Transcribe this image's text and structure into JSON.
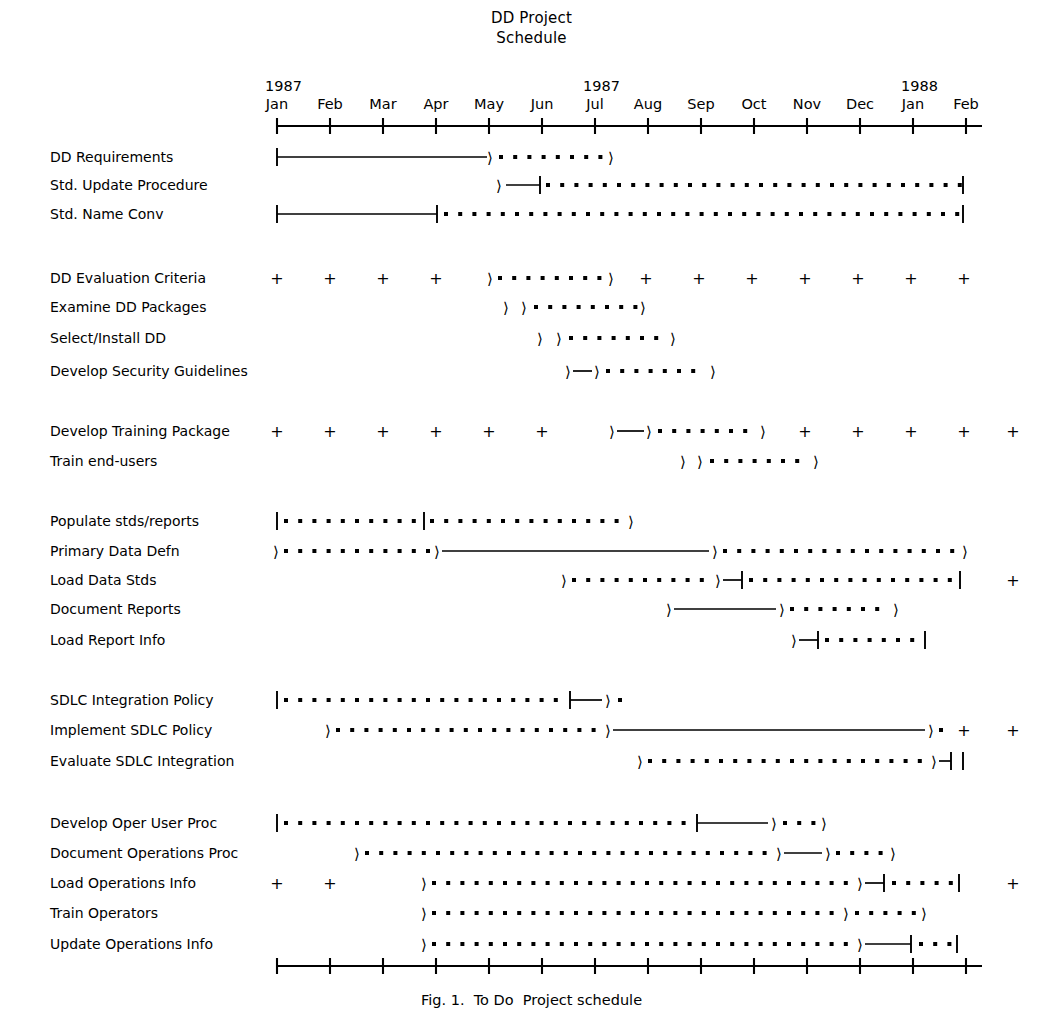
{
  "header": {
    "title_line1": "DD Project",
    "title_line2": "Schedule"
  },
  "caption": {
    "text": "Fig. 1.  To Do  Project schedule"
  },
  "axis": {
    "month_labels": [
      "Jan",
      "Feb",
      "Mar",
      "Apr",
      "May",
      "Jun",
      "Jul",
      "Aug",
      "Sep",
      "Oct",
      "Nov",
      "Dec",
      "Jan",
      "Feb"
    ],
    "year_labels": [
      {
        "text": "1987",
        "at_month_index": 0
      },
      {
        "text": "1987",
        "at_month_index": 6
      },
      {
        "text": "1988",
        "at_month_index": 12
      }
    ],
    "tick_count": 14,
    "axis_start_px": 277,
    "axis_end_px": 981,
    "month_spacing_px": 53.0,
    "top_axis_y": 126,
    "bottom_axis_y": 966
  },
  "legend_symbols": {
    "solid_line": "planned duration",
    "dotted_line": "actual / projected duration",
    "arrow": "milestone marker",
    "plus": "period marker",
    "tick_cap": "start or end cap"
  },
  "chart_data": {
    "type": "bar",
    "chart_kind": "gantt",
    "title": "DD Project Schedule",
    "xlabel": "",
    "ylabel": "",
    "x_axis_type": "time-months",
    "x_categories": [
      "Jan 1987",
      "Feb 1987",
      "Mar 1987",
      "Apr 1987",
      "May 1987",
      "Jun 1987",
      "Jul 1987",
      "Aug 1987",
      "Sep 1987",
      "Oct 1987",
      "Nov 1987",
      "Dec 1987",
      "Jan 1988",
      "Feb 1988"
    ],
    "xlim": [
      0,
      13
    ],
    "grid": false,
    "legend_position": "none",
    "categories": [
      "DD Requirements",
      "Std. Update Procedure",
      "Std. Name Conv",
      "DD Evaluation Criteria",
      "Examine DD Packages",
      "Select/Install DD",
      "Develop Security Guidelines",
      "Develop Training Package",
      "Train end-users",
      "Populate stds/reports",
      "Primary Data Defn",
      "Load Data Stds",
      "Document Reports",
      "Load Report Info",
      "SDLC Integration Policy",
      "Implement SDLC Policy",
      "Evaluate SDLC Integration",
      "Develop Oper User Proc",
      "Document Operations Proc",
      "Load Operations Info",
      "Train Operators",
      "Update Operations Info"
    ],
    "rows": [
      {
        "label": "DD Requirements",
        "y": 157,
        "group": 0,
        "marks": [
          {
            "type": "cap",
            "x": 277
          },
          {
            "type": "solid",
            "x1": 277,
            "x2": 487
          },
          {
            "type": "arrow",
            "x": 487
          },
          {
            "type": "dots",
            "x1": 501,
            "x2": 604
          },
          {
            "type": "arrow",
            "x": 608
          }
        ],
        "plus_at": []
      },
      {
        "label": "Std. Update Procedure",
        "y": 185,
        "group": 0,
        "marks": [
          {
            "type": "arrow",
            "x": 496
          },
          {
            "type": "solid",
            "x1": 506,
            "x2": 540
          },
          {
            "type": "cap",
            "x": 540
          },
          {
            "type": "dots",
            "x1": 548,
            "x2": 955
          },
          {
            "type": "cap",
            "x": 963
          }
        ],
        "plus_at": []
      },
      {
        "label": "Std. Name Conv",
        "y": 214,
        "group": 0,
        "marks": [
          {
            "type": "cap",
            "x": 277
          },
          {
            "type": "solid",
            "x1": 277,
            "x2": 437
          },
          {
            "type": "cap",
            "x": 437
          },
          {
            "type": "dots",
            "x1": 446,
            "x2": 954
          },
          {
            "type": "cap",
            "x": 963
          }
        ],
        "plus_at": []
      },
      {
        "label": "DD Evaluation Criteria",
        "y": 278,
        "group": 1,
        "marks": [
          {
            "type": "arrow",
            "x": 487
          },
          {
            "type": "dots",
            "x1": 500,
            "x2": 601
          },
          {
            "type": "arrow",
            "x": 608
          }
        ],
        "plus_at": [
          277,
          330,
          383,
          436,
          646,
          699,
          752,
          805,
          858,
          911,
          964
        ]
      },
      {
        "label": "Examine DD Packages",
        "y": 307,
        "group": 1,
        "marks": [
          {
            "type": "arrow",
            "x": 503
          },
          {
            "type": "arrow",
            "x": 521
          },
          {
            "type": "dots",
            "x1": 536,
            "x2": 632
          },
          {
            "type": "arrow",
            "x": 640
          }
        ],
        "plus_at": []
      },
      {
        "label": "Select/Install DD",
        "y": 338,
        "group": 1,
        "marks": [
          {
            "type": "arrow",
            "x": 537
          },
          {
            "type": "arrow",
            "x": 556
          },
          {
            "type": "dots",
            "x1": 571,
            "x2": 661
          },
          {
            "type": "arrow",
            "x": 670
          }
        ],
        "plus_at": []
      },
      {
        "label": "Develop Security Guidelines",
        "y": 371,
        "group": 1,
        "marks": [
          {
            "type": "arrow",
            "x": 565
          },
          {
            "type": "solid",
            "x1": 573,
            "x2": 592
          },
          {
            "type": "arrow",
            "x": 594
          },
          {
            "type": "dots",
            "x1": 608,
            "x2": 700
          },
          {
            "type": "arrow",
            "x": 710
          }
        ],
        "plus_at": []
      },
      {
        "label": "Develop Training Package",
        "y": 431,
        "group": 2,
        "marks": [
          {
            "type": "arrow",
            "x": 609
          },
          {
            "type": "solid",
            "x1": 617,
            "x2": 644
          },
          {
            "type": "arrow",
            "x": 646
          },
          {
            "type": "dots",
            "x1": 660,
            "x2": 749
          },
          {
            "type": "arrow",
            "x": 760
          }
        ],
        "plus_at": [
          277,
          330,
          383,
          436,
          489,
          542,
          805,
          858,
          911,
          964,
          1013
        ]
      },
      {
        "label": "Train end-users",
        "y": 461,
        "group": 2,
        "marks": [
          {
            "type": "arrow",
            "x": 680
          },
          {
            "type": "arrow",
            "x": 697
          },
          {
            "type": "dots",
            "x1": 712,
            "x2": 804
          },
          {
            "type": "arrow",
            "x": 813
          }
        ],
        "plus_at": []
      },
      {
        "label": "Populate stds/reports",
        "y": 521,
        "group": 3,
        "marks": [
          {
            "type": "cap",
            "x": 277
          },
          {
            "type": "dots",
            "x1": 286,
            "x2": 417
          },
          {
            "type": "cap",
            "x": 424
          },
          {
            "type": "dots",
            "x1": 432,
            "x2": 617
          },
          {
            "type": "arrow",
            "x": 628
          }
        ],
        "plus_at": []
      },
      {
        "label": "Primary Data Defn",
        "y": 551,
        "group": 3,
        "marks": [
          {
            "type": "arrow",
            "x": 273
          },
          {
            "type": "dots",
            "x1": 286,
            "x2": 426
          },
          {
            "type": "arrow",
            "x": 434
          },
          {
            "type": "solid",
            "x1": 442,
            "x2": 709
          },
          {
            "type": "arrow",
            "x": 712
          },
          {
            "type": "dots",
            "x1": 725,
            "x2": 952
          },
          {
            "type": "arrow",
            "x": 962
          }
        ],
        "plus_at": []
      },
      {
        "label": "Load Data Stds",
        "y": 580,
        "group": 3,
        "marks": [
          {
            "type": "arrow",
            "x": 561
          },
          {
            "type": "dots",
            "x1": 574,
            "x2": 707
          },
          {
            "type": "arrow",
            "x": 715
          },
          {
            "type": "solid",
            "x1": 723,
            "x2": 742
          },
          {
            "type": "cap",
            "x": 742
          },
          {
            "type": "dots",
            "x1": 751,
            "x2": 952
          },
          {
            "type": "cap",
            "x": 960
          }
        ],
        "plus_at": [
          1013
        ]
      },
      {
        "label": "Document Reports",
        "y": 609,
        "group": 3,
        "marks": [
          {
            "type": "arrow",
            "x": 666
          },
          {
            "type": "solid",
            "x1": 674,
            "x2": 776
          },
          {
            "type": "arrow",
            "x": 779
          },
          {
            "type": "dots",
            "x1": 792,
            "x2": 884
          },
          {
            "type": "arrow",
            "x": 893
          }
        ],
        "plus_at": []
      },
      {
        "label": "Load Report Info",
        "y": 640,
        "group": 3,
        "marks": [
          {
            "type": "arrow",
            "x": 791
          },
          {
            "type": "solid",
            "x1": 799,
            "x2": 818
          },
          {
            "type": "cap",
            "x": 818
          },
          {
            "type": "dots",
            "x1": 827,
            "x2": 917
          },
          {
            "type": "cap",
            "x": 925
          }
        ],
        "plus_at": []
      },
      {
        "label": "SDLC Integration Policy",
        "y": 700,
        "group": 4,
        "marks": [
          {
            "type": "cap",
            "x": 277
          },
          {
            "type": "dots",
            "x1": 286,
            "x2": 562
          },
          {
            "type": "cap",
            "x": 570
          },
          {
            "type": "solid",
            "x1": 570,
            "x2": 602
          },
          {
            "type": "arrow",
            "x": 605
          },
          {
            "type": "dots",
            "x1": 620,
            "x2": 620
          }
        ],
        "plus_at": []
      },
      {
        "label": "Implement SDLC Policy",
        "y": 730,
        "group": 4,
        "marks": [
          {
            "type": "arrow",
            "x": 325
          },
          {
            "type": "dots",
            "x1": 338,
            "x2": 597
          },
          {
            "type": "arrow",
            "x": 605
          },
          {
            "type": "solid",
            "x1": 613,
            "x2": 925
          },
          {
            "type": "arrow",
            "x": 928
          },
          {
            "type": "dots",
            "x1": 941,
            "x2": 941
          }
        ],
        "plus_at": [
          964,
          1013
        ]
      },
      {
        "label": "Evaluate SDLC Integration",
        "y": 761,
        "group": 4,
        "marks": [
          {
            "type": "arrow",
            "x": 637
          },
          {
            "type": "dots",
            "x1": 650,
            "x2": 923
          },
          {
            "type": "arrow",
            "x": 931
          },
          {
            "type": "solid",
            "x1": 939,
            "x2": 951
          },
          {
            "type": "cap",
            "x": 951
          },
          {
            "type": "cap",
            "x": 963
          }
        ],
        "plus_at": []
      },
      {
        "label": "Develop Oper User Proc",
        "y": 823,
        "group": 5,
        "marks": [
          {
            "type": "cap",
            "x": 277
          },
          {
            "type": "dots",
            "x1": 286,
            "x2": 687
          },
          {
            "type": "cap",
            "x": 697
          },
          {
            "type": "solid",
            "x1": 697,
            "x2": 768
          },
          {
            "type": "arrow",
            "x": 771
          },
          {
            "type": "dots",
            "x1": 785,
            "x2": 813
          },
          {
            "type": "arrow",
            "x": 821
          }
        ],
        "plus_at": []
      },
      {
        "label": "Document Operations Proc",
        "y": 853,
        "group": 5,
        "marks": [
          {
            "type": "arrow",
            "x": 354
          },
          {
            "type": "dots",
            "x1": 367,
            "x2": 768
          },
          {
            "type": "arrow",
            "x": 776
          },
          {
            "type": "solid",
            "x1": 784,
            "x2": 822
          },
          {
            "type": "arrow",
            "x": 825
          },
          {
            "type": "dots",
            "x1": 838,
            "x2": 880
          },
          {
            "type": "arrow",
            "x": 890
          }
        ],
        "plus_at": []
      },
      {
        "label": "Load Operations Info",
        "y": 883,
        "group": 5,
        "marks": [
          {
            "type": "arrow",
            "x": 421
          },
          {
            "type": "dots",
            "x1": 434,
            "x2": 849
          },
          {
            "type": "arrow",
            "x": 857
          },
          {
            "type": "solid",
            "x1": 865,
            "x2": 884
          },
          {
            "type": "cap",
            "x": 884
          },
          {
            "type": "dots",
            "x1": 894,
            "x2": 951
          },
          {
            "type": "cap",
            "x": 959
          }
        ],
        "plus_at": [
          277,
          330,
          1013
        ]
      },
      {
        "label": "Train Operators",
        "y": 913,
        "group": 5,
        "marks": [
          {
            "type": "arrow",
            "x": 421
          },
          {
            "type": "dots",
            "x1": 434,
            "x2": 835
          },
          {
            "type": "arrow",
            "x": 843
          },
          {
            "type": "dots",
            "x1": 857,
            "x2": 913
          },
          {
            "type": "arrow",
            "x": 921
          }
        ],
        "plus_at": []
      },
      {
        "label": "Update Operations Info",
        "y": 944,
        "group": 5,
        "marks": [
          {
            "type": "arrow",
            "x": 421
          },
          {
            "type": "dots",
            "x1": 434,
            "x2": 849
          },
          {
            "type": "arrow",
            "x": 857
          },
          {
            "type": "solid",
            "x1": 865,
            "x2": 911
          },
          {
            "type": "cap",
            "x": 911
          },
          {
            "type": "dots",
            "x1": 921,
            "x2": 949
          },
          {
            "type": "cap",
            "x": 957
          }
        ],
        "plus_at": []
      }
    ]
  },
  "colors": {
    "ink": "#000000",
    "background": "#ffffff"
  }
}
